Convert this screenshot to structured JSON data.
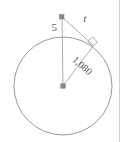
{
  "figure": {
    "name": "circle-tangent-diagram",
    "type": "geometry-diagram",
    "background_color": "#ffffff",
    "stroke_color": "#8c8c8c",
    "point_color": "#808080",
    "label_color": "#5a5a5a",
    "border_color": "#cfcfcf"
  },
  "labels": {
    "external_segment": "5",
    "tangent": "t",
    "radius": "1,080"
  },
  "geometry": {
    "circle": {
      "center_x": 63,
      "center_y": 86,
      "radius": 49
    },
    "external_point": {
      "x": 62,
      "y": 17
    },
    "tangent_point": {
      "x": 93,
      "y": 45
    },
    "top_point": {
      "x": 63,
      "y": 37
    },
    "right_angle_marker": {
      "size": 8
    }
  },
  "label_positions": {
    "external_segment": {
      "x": 57,
      "y": 31,
      "rotation": 0,
      "font_size": 11
    },
    "tangent": {
      "x": 85,
      "y": 22,
      "rotation": 0,
      "font_size": 10
    },
    "radius": {
      "x": 80,
      "y": 68,
      "rotation": 42,
      "font_size": 10
    }
  }
}
